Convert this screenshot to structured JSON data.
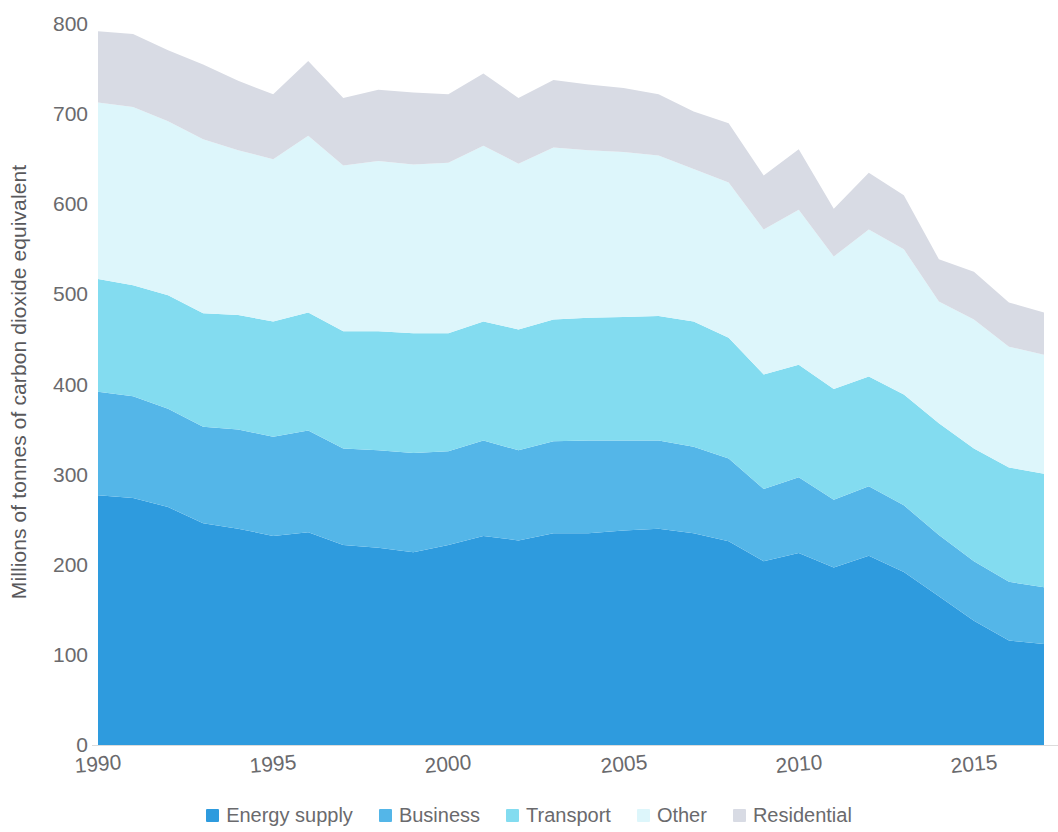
{
  "chart_data": {
    "type": "area",
    "stacked": true,
    "title": "",
    "subtitle": "",
    "xlabel": "",
    "ylabel": "Millions of tonnes of carbon dioxide equivalent",
    "xlim": [
      1990,
      2017.4
    ],
    "ylim": [
      0,
      800
    ],
    "ytick_labels": [
      "0",
      "100",
      "200",
      "300",
      "400",
      "500",
      "600",
      "700",
      "800"
    ],
    "ytick_values": [
      0,
      100,
      200,
      300,
      400,
      500,
      600,
      700,
      800
    ],
    "xtick_labels": [
      "1990",
      "1995",
      "2000",
      "2005",
      "2010",
      "2015"
    ],
    "xtick_values": [
      1990,
      1995,
      2000,
      2005,
      2010,
      2015
    ],
    "grid": false,
    "legend_position": "bottom",
    "x": [
      1990,
      1991,
      1992,
      1993,
      1994,
      1995,
      1996,
      1997,
      1998,
      1999,
      2000,
      2001,
      2002,
      2003,
      2004,
      2005,
      2006,
      2007,
      2008,
      2009,
      2010,
      2011,
      2012,
      2013,
      2014,
      2015,
      2016,
      2017
    ],
    "series": [
      {
        "name": "Energy supply",
        "color": "#2E9BDE",
        "values": [
          277,
          274,
          264,
          246,
          240,
          232,
          236,
          222,
          219,
          214,
          222,
          232,
          227,
          235,
          235,
          238,
          240,
          235,
          226,
          204,
          213,
          197,
          210,
          192,
          165,
          138,
          116,
          112
        ]
      },
      {
        "name": "Business",
        "color": "#54B6E8",
        "values": [
          115,
          113,
          109,
          107,
          110,
          110,
          113,
          107,
          108,
          110,
          104,
          106,
          100,
          102,
          103,
          100,
          98,
          96,
          92,
          80,
          84,
          75,
          77,
          74,
          68,
          66,
          65,
          63
        ]
      },
      {
        "name": "Transport",
        "color": "#83DCF0",
        "values": [
          125,
          123,
          126,
          126,
          127,
          128,
          131,
          130,
          132,
          133,
          131,
          132,
          134,
          135,
          136,
          137,
          138,
          139,
          134,
          127,
          125,
          123,
          122,
          123,
          124,
          125,
          127,
          126
        ]
      },
      {
        "name": "Other",
        "color": "#DDF6FB",
        "values": [
          196,
          198,
          193,
          193,
          183,
          180,
          196,
          184,
          189,
          187,
          189,
          195,
          184,
          191,
          186,
          183,
          178,
          169,
          172,
          161,
          172,
          147,
          163,
          161,
          135,
          143,
          134,
          132
        ]
      },
      {
        "name": "Residential",
        "color": "#D8DBE4",
        "values": [
          79,
          81,
          79,
          83,
          77,
          72,
          83,
          75,
          79,
          80,
          76,
          80,
          73,
          75,
          73,
          71,
          68,
          64,
          66,
          60,
          67,
          53,
          63,
          60,
          47,
          53,
          49,
          47
        ]
      }
    ],
    "totals": [
      792,
      789,
      771,
      755,
      737,
      722,
      759,
      718,
      727,
      724,
      722,
      745,
      718,
      738,
      733,
      729,
      722,
      703,
      690,
      632,
      661,
      595,
      635,
      610,
      539,
      525,
      491,
      480
    ]
  },
  "legend": {
    "items": [
      {
        "label": "Energy supply",
        "color": "#2E9BDE"
      },
      {
        "label": "Business",
        "color": "#54B6E8"
      },
      {
        "label": "Transport",
        "color": "#83DCF0"
      },
      {
        "label": "Other",
        "color": "#DDF6FB"
      },
      {
        "label": "Residential",
        "color": "#D8DBE4"
      }
    ]
  }
}
